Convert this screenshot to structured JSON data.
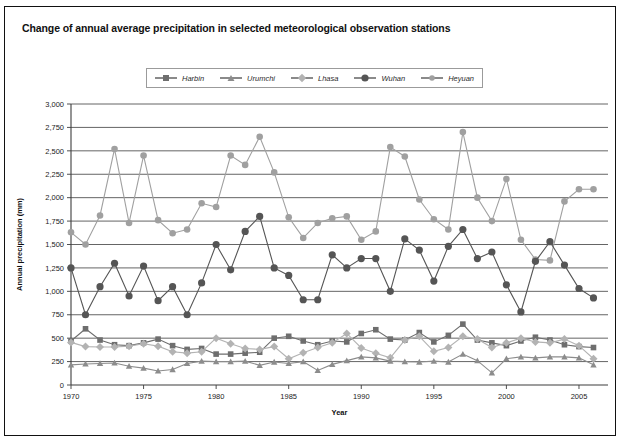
{
  "chart_data": {
    "type": "line",
    "title": "Change of annual average precipitation in selected meteorological observation stations",
    "xlabel": "Year",
    "ylabel": "Annual precipitation (mm)",
    "xlim": [
      1970,
      2007
    ],
    "ylim": [
      0,
      3000
    ],
    "ytick_step": 250,
    "yticks": [
      "0",
      "250",
      "500",
      "750",
      "1,000",
      "1,250",
      "1,500",
      "1,750",
      "2,000",
      "2,250",
      "2,500",
      "2,750",
      "3,000"
    ],
    "xticks": [
      "1970",
      "1975",
      "1980",
      "1985",
      "1990",
      "1995",
      "2000",
      "2005"
    ],
    "grid": true,
    "legend_position": "top-center",
    "x": [
      1970,
      1971,
      1972,
      1973,
      1974,
      1975,
      1976,
      1977,
      1978,
      1979,
      1980,
      1981,
      1982,
      1983,
      1984,
      1985,
      1986,
      1987,
      1988,
      1989,
      1990,
      1991,
      1992,
      1993,
      1994,
      1995,
      1996,
      1997,
      1998,
      1999,
      2000,
      2001,
      2002,
      2003,
      2004,
      2005,
      2006
    ],
    "series": [
      {
        "name": "Harbin",
        "marker": "square",
        "color": "#6e6e6e",
        "values": [
          470,
          600,
          480,
          430,
          420,
          450,
          490,
          420,
          380,
          390,
          330,
          330,
          340,
          350,
          500,
          520,
          470,
          430,
          470,
          460,
          550,
          590,
          490,
          480,
          560,
          460,
          530,
          650,
          480,
          450,
          420,
          470,
          510,
          480,
          430,
          410,
          400
        ]
      },
      {
        "name": "Urumchi",
        "marker": "triangle",
        "color": "#8c8c8c",
        "values": [
          215,
          225,
          230,
          235,
          200,
          180,
          150,
          165,
          230,
          255,
          250,
          250,
          255,
          210,
          245,
          230,
          250,
          155,
          220,
          260,
          300,
          290,
          255,
          250,
          245,
          255,
          245,
          330,
          260,
          130,
          280,
          300,
          290,
          300,
          300,
          290,
          215
        ]
      },
      {
        "name": "Lhasa",
        "marker": "diamond",
        "color": "#b3b3b3",
        "values": [
          455,
          410,
          405,
          405,
          415,
          440,
          415,
          355,
          340,
          355,
          500,
          440,
          390,
          380,
          410,
          280,
          345,
          400,
          450,
          550,
          395,
          340,
          290,
          480,
          520,
          360,
          400,
          520,
          490,
          400,
          450,
          500,
          460,
          450,
          490,
          420,
          280
        ]
      },
      {
        "name": "Wuhan",
        "marker": "circle-dark",
        "color": "#555555",
        "values": [
          1250,
          750,
          1050,
          1300,
          950,
          1270,
          900,
          1050,
          750,
          1090,
          1500,
          1230,
          1640,
          1800,
          1250,
          1170,
          910,
          910,
          1390,
          1250,
          1350,
          1350,
          1000,
          1560,
          1440,
          1110,
          1480,
          1660,
          1350,
          1420,
          1070,
          780,
          1320,
          1530,
          1280,
          1030,
          930
        ]
      },
      {
        "name": "Heyuan",
        "marker": "circle-light",
        "color": "#a0a0a0",
        "values": [
          1630,
          1500,
          1810,
          2520,
          1730,
          2450,
          1760,
          1620,
          1660,
          1940,
          1900,
          2450,
          2350,
          2650,
          2270,
          1790,
          1570,
          1730,
          1780,
          1800,
          1550,
          1640,
          2540,
          2440,
          1980,
          1770,
          1660,
          2700,
          2000,
          1750,
          2200,
          1550,
          1340,
          1330,
          1960,
          2090,
          2090
        ]
      }
    ]
  }
}
